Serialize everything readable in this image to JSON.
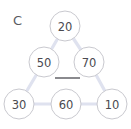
{
  "panel": {
    "label": "C"
  },
  "chart_data": {
    "type": "diagram",
    "title": "C",
    "nodes": [
      {
        "id": "n20",
        "label": "20",
        "x": 65,
        "y": 26,
        "r": 15
      },
      {
        "id": "n50",
        "label": "50",
        "x": 44,
        "y": 62,
        "r": 15
      },
      {
        "id": "n70",
        "label": "70",
        "x": 89,
        "y": 62,
        "r": 15
      },
      {
        "id": "n30",
        "label": "30",
        "x": 19,
        "y": 104,
        "r": 15
      },
      {
        "id": "n60",
        "label": "60",
        "x": 66,
        "y": 104,
        "r": 15
      },
      {
        "id": "n10",
        "label": "10",
        "x": 112,
        "y": 104,
        "r": 15
      }
    ],
    "edges": [
      {
        "from": "n20",
        "to": "n50"
      },
      {
        "from": "n20",
        "to": "n70"
      },
      {
        "from": "n50",
        "to": "n30"
      },
      {
        "from": "n70",
        "to": "n10"
      },
      {
        "from": "n30",
        "to": "n60"
      },
      {
        "from": "n60",
        "to": "n10"
      }
    ],
    "annotations": [
      {
        "id": "bar",
        "type": "horizontal-bar",
        "x1": 55,
        "x2": 80,
        "y": 78
      }
    ],
    "edge_color": "#dfe2ef",
    "node_fill": "#ffffff",
    "node_stroke": "#c9c9cf",
    "text_color": "#4a4a50",
    "background": "#ffffff"
  }
}
